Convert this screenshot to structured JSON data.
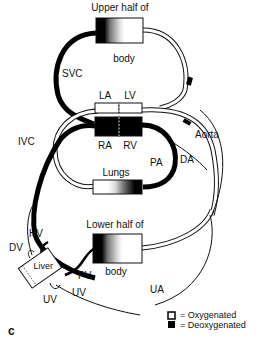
{
  "diagram": {
    "panel_label": "c",
    "organs": {
      "upper_body": {
        "line1": "Upper half of",
        "line2": "body"
      },
      "lungs": {
        "label": "Lungs"
      },
      "lower_body": {
        "line1": "Lower half of",
        "line2": "body"
      },
      "liver": {
        "label": "Liver"
      }
    },
    "heart": {
      "la": "LA",
      "lv": "LV",
      "ra": "RA",
      "rv": "RV"
    },
    "vessels": {
      "svc": "SVC",
      "ivc": "IVC",
      "aorta": "Aorta",
      "pa": "PA",
      "da": "DA",
      "hv": "HV",
      "dv": "DV",
      "pv": "PV",
      "uv_inner": "UV",
      "uv_outer": "UV",
      "ua": "UA"
    },
    "legend": {
      "oxygenated": "= Oxygenated",
      "deoxygenated": "= Deoxygenated"
    },
    "colors": {
      "deoxygenated": "#000000",
      "oxygenated": "#ffffff",
      "stroke": "#111111"
    }
  }
}
